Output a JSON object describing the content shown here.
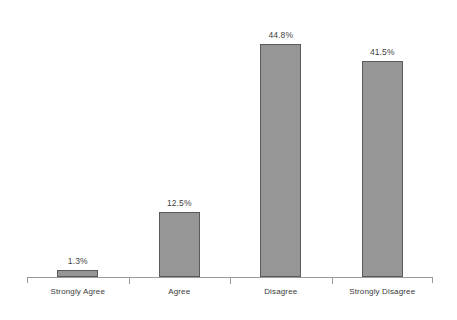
{
  "chart_data": {
    "type": "bar",
    "title": "",
    "subtitle": "",
    "xlabel": "",
    "ylabel": "",
    "categories": [
      "Strongly Agree",
      "Agree",
      "Disagree",
      "Strongly Disagree"
    ],
    "values": [
      1.3,
      12.5,
      44.8,
      41.5
    ],
    "value_labels": [
      "1.3%",
      "12.5%",
      "44.8%",
      "41.5%"
    ],
    "ylim": [
      0,
      48
    ],
    "grid": false,
    "legend": false,
    "series": [
      {
        "name": "Response share",
        "values": [
          1.3,
          12.5,
          44.8,
          41.5
        ]
      }
    ],
    "colors": {
      "bar_fill": "#969696",
      "bar_border": "#5a5a5a",
      "axis": "#9a9a9a",
      "label_text": "#3a3a3a",
      "value_text": "#3f3f3f",
      "background": "#ffffff"
    }
  }
}
